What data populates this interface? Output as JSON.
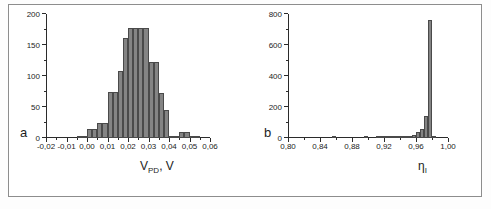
{
  "figure": {
    "panel_letters": {
      "a": "a",
      "b": "b"
    },
    "caption": ""
  },
  "chart_data": [
    {
      "type": "bar",
      "panel": "a",
      "title": "",
      "xlabel": "V_PD, V",
      "xlabel_base": "V",
      "xlabel_sub": "PD",
      "xlabel_tail": ", V",
      "ylabel": "",
      "xlim": [
        -0.02,
        0.06
      ],
      "ylim": [
        0,
        200
      ],
      "grid": false,
      "legend": "none",
      "xticks": [
        "-0,02",
        "-0,01",
        "0,00",
        "0,01",
        "0,02",
        "0,03",
        "0,04",
        "0,05",
        "0,06"
      ],
      "xtick_values": [
        -0.02,
        -0.01,
        0.0,
        0.01,
        0.02,
        0.03,
        0.04,
        0.05,
        0.06
      ],
      "yticks": [
        "0",
        "50",
        "100",
        "150",
        "200"
      ],
      "ytick_values": [
        0,
        50,
        100,
        150,
        200
      ],
      "yminor_step": 25,
      "bin_width": 0.0025,
      "bin_starts": [
        -0.02,
        -0.0175,
        -0.015,
        -0.0125,
        -0.01,
        -0.0075,
        -0.005,
        -0.0025,
        0.0,
        0.0025,
        0.005,
        0.0075,
        0.01,
        0.0125,
        0.015,
        0.0175,
        0.02,
        0.0225,
        0.025,
        0.0275,
        0.03,
        0.0325,
        0.035,
        0.0375,
        0.04,
        0.0425,
        0.045,
        0.0475,
        0.05,
        0.0525,
        0.055,
        0.0575
      ],
      "values": [
        0,
        0,
        0,
        0,
        0,
        0,
        3,
        3,
        14,
        14,
        25,
        25,
        74,
        74,
        108,
        162,
        178,
        178,
        177,
        177,
        122,
        122,
        72,
        45,
        4,
        4,
        9,
        9,
        2,
        1,
        0,
        0
      ]
    },
    {
      "type": "bar",
      "panel": "b",
      "title": "",
      "xlabel": "eta_I",
      "xlabel_base": "η",
      "xlabel_sub": "I",
      "ylabel": "",
      "xlim": [
        0.8,
        1.0
      ],
      "ylim": [
        0,
        800
      ],
      "grid": false,
      "legend": "none",
      "xticks": [
        "0,80",
        "0,84",
        "0,88",
        "0,92",
        "0,96",
        "1,00"
      ],
      "xtick_values": [
        0.8,
        0.84,
        0.88,
        0.92,
        0.96,
        1.0
      ],
      "yticks": [
        "0",
        "200",
        "400",
        "600",
        "800"
      ],
      "ytick_values": [
        0,
        200,
        400,
        600,
        800
      ],
      "yminor_step": 100,
      "bin_width": 0.005,
      "bin_starts": [
        0.8,
        0.805,
        0.81,
        0.815,
        0.82,
        0.825,
        0.83,
        0.835,
        0.84,
        0.845,
        0.85,
        0.855,
        0.86,
        0.865,
        0.87,
        0.875,
        0.88,
        0.885,
        0.89,
        0.895,
        0.9,
        0.905,
        0.91,
        0.915,
        0.92,
        0.925,
        0.93,
        0.935,
        0.94,
        0.945,
        0.95,
        0.955,
        0.96,
        0.965,
        0.97,
        0.975,
        0.98,
        0.985,
        0.99,
        0.995
      ],
      "values": [
        0,
        0,
        0,
        0,
        0,
        0,
        0,
        0,
        0,
        0,
        0,
        2,
        0,
        0,
        0,
        0,
        0,
        0,
        0,
        2,
        0,
        0,
        3,
        3,
        5,
        2,
        4,
        4,
        6,
        6,
        10,
        22,
        38,
        60,
        140,
        760,
        4,
        0,
        0,
        0
      ]
    }
  ]
}
